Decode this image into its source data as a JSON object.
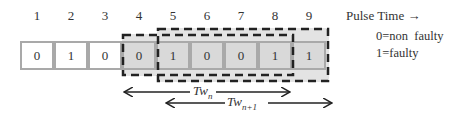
{
  "pulse_numbers": [
    "1",
    "2",
    "3",
    "4",
    "5",
    "6",
    "7",
    "8",
    "9"
  ],
  "cells": [
    {
      "value": "0",
      "shaded": false
    },
    {
      "value": "1",
      "shaded": false
    },
    {
      "value": "0",
      "shaded": false
    },
    {
      "value": "0",
      "shaded": true
    },
    {
      "value": "1",
      "shaded": true
    },
    {
      "value": "0",
      "shaded": true
    },
    {
      "value": "0",
      "shaded": true
    },
    {
      "value": "1",
      "shaded": true
    },
    {
      "value": "1",
      "shaded": true
    }
  ],
  "axis_label": "Pulse Time →",
  "legend": {
    "line1": "0=non  faulty",
    "line2": "1=faulty"
  },
  "windows": {
    "tw_n": {
      "label": "Tw",
      "subscript": "n",
      "span": "cells 4-8"
    },
    "tw_n1": {
      "label": "Tw",
      "subscript": "n+1",
      "span": "cells 5-9"
    }
  },
  "colors": {
    "cell_border": "#a9a9a9",
    "shaded_fill": "#d9d9d9",
    "window_fill": "#e3e3e3",
    "dash": "#222222"
  }
}
